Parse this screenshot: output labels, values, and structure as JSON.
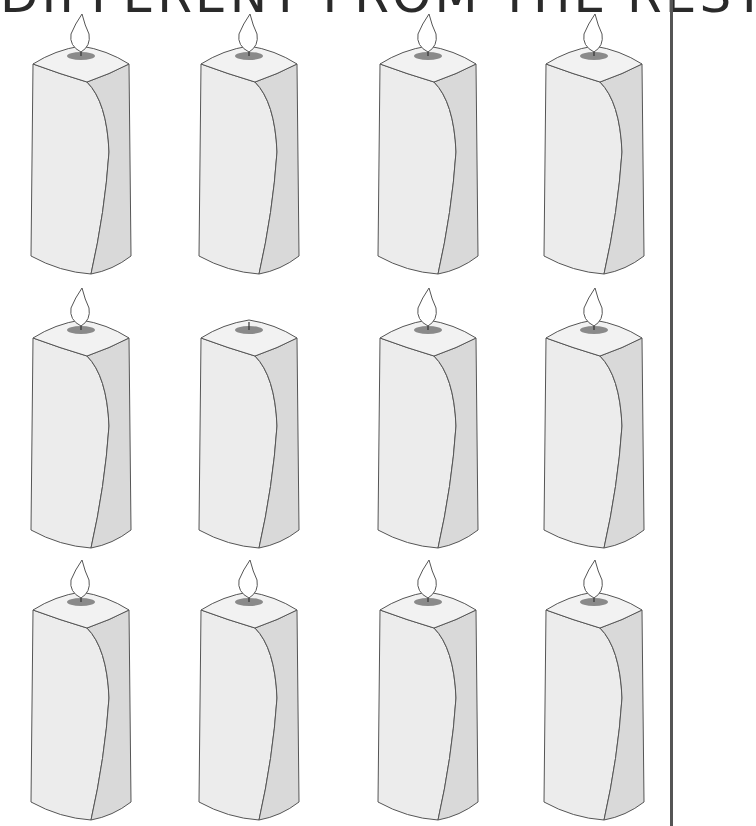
{
  "title": "DIFFERENT FROM THE REST",
  "colors": {
    "outline": "#555555",
    "front_face": "#ececec",
    "side_face": "#d9d9d9",
    "top_face": "#f2f2f2",
    "wax_pool": "#8a8a8a",
    "flame": "#ffffff",
    "border": "#555555"
  },
  "puzzle": {
    "rows": 3,
    "columns": 4,
    "candles": [
      {
        "row": 1,
        "col": 1,
        "lit": true
      },
      {
        "row": 1,
        "col": 2,
        "lit": true
      },
      {
        "row": 1,
        "col": 3,
        "lit": true
      },
      {
        "row": 1,
        "col": 4,
        "lit": true
      },
      {
        "row": 2,
        "col": 1,
        "lit": true
      },
      {
        "row": 2,
        "col": 2,
        "lit": false
      },
      {
        "row": 2,
        "col": 3,
        "lit": true
      },
      {
        "row": 2,
        "col": 4,
        "lit": true
      },
      {
        "row": 3,
        "col": 1,
        "lit": true
      },
      {
        "row": 3,
        "col": 2,
        "lit": true
      },
      {
        "row": 3,
        "col": 3,
        "lit": true
      },
      {
        "row": 3,
        "col": 4,
        "lit": true
      }
    ]
  }
}
